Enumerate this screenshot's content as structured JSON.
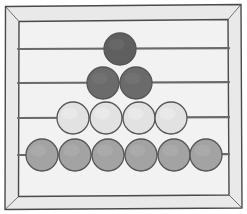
{
  "figure": {
    "title": "Abacus counting frame",
    "subject": "abacus",
    "caption": "Four-rod abacus with beads arranged in a triangular stack",
    "background_color": "#ffffff"
  },
  "frame": {
    "name": "abacus-frame",
    "fill_color": "#e9e9e9",
    "inner_panel_color": "#f2f2f2",
    "stroke_color": "#4a4a4a",
    "stroke_width": 1.4,
    "outer": {
      "x": 4,
      "y": 5,
      "width": 238,
      "height": 204
    },
    "inner": {
      "x": 18,
      "y": 20,
      "width": 211,
      "height": 175
    },
    "style": "hand-drawn wooden frame with slight perspective"
  },
  "rods": [
    {
      "id": "rod-1",
      "label": "Rod 1 (top)",
      "y": 49,
      "x_start": 18,
      "x_end": 229,
      "color": "#6a6a6a",
      "bead_count": 1
    },
    {
      "id": "rod-2",
      "label": "Rod 2",
      "y": 83,
      "x_start": 18,
      "x_end": 229,
      "color": "#6a6a6a",
      "bead_count": 2
    },
    {
      "id": "rod-3",
      "label": "Rod 3",
      "y": 118,
      "x_start": 18,
      "x_end": 229,
      "color": "#6a6a6a",
      "bead_count": 4
    },
    {
      "id": "rod-4",
      "label": "Rod 4 (bottom)",
      "y": 155,
      "x_start": 18,
      "x_end": 229,
      "color": "#6a6a6a",
      "bead_count": 6
    }
  ],
  "beads": {
    "radius": 16,
    "outline_color": "#555555",
    "outline_width": 1.3,
    "rows": [
      {
        "row": 1,
        "name": "bead-row-1",
        "count": 1,
        "fill_color": "#5f5f5f",
        "highlight_color": "#6e6e6e",
        "cy": 49,
        "cx": [
          120
        ]
      },
      {
        "row": 2,
        "name": "bead-row-2",
        "count": 2,
        "fill_color": "#6b6b6b",
        "highlight_color": "#797979",
        "cy": 83,
        "cx": [
          103,
          136
        ]
      },
      {
        "row": 3,
        "name": "bead-row-3",
        "count": 4,
        "fill_color": "#e2e2e2",
        "highlight_color": "#eeeeee",
        "cy": 118,
        "cx": [
          73,
          106,
          139,
          171
        ]
      },
      {
        "row": 4,
        "name": "bead-row-4",
        "count": 6,
        "fill_color": "#a3a3a3",
        "highlight_color": "#b0b0b0",
        "cy": 155,
        "cx": [
          42,
          75,
          108,
          141,
          174,
          206
        ]
      }
    ]
  },
  "totals": {
    "bead_total": 13,
    "rod_total": 4,
    "counts_label": "1 + 2 + 4 + 6 = 13 beads"
  }
}
